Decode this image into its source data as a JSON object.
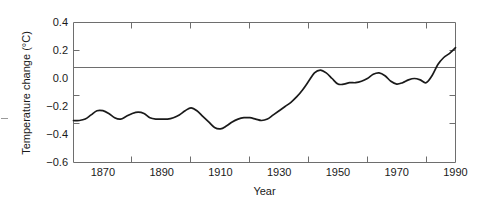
{
  "chart_data": {
    "type": "line",
    "title": "",
    "xlabel": "Year",
    "ylabel": "Temperature change (°C)",
    "xlim": [
      1860,
      1990
    ],
    "ylim": [
      -0.6,
      0.4
    ],
    "xticks": [
      1870,
      1890,
      1910,
      1930,
      1950,
      1970,
      1990
    ],
    "yticks": [
      0.4,
      0.2,
      0.0,
      -0.2,
      -0.4,
      -0.6
    ],
    "xtick_labels": [
      "1870",
      "1890",
      "1910",
      "1930",
      "1950",
      "1970",
      "1990"
    ],
    "ytick_labels": [
      "0.4",
      "0.2",
      "0.0",
      "−0.2",
      "−0.4",
      "−0.6"
    ],
    "grid": false,
    "zero_line": true,
    "legend": null,
    "line_color": "#1a1a1a",
    "axis_color": "#6e6e6e",
    "series": [
      {
        "name": "Global temperature change",
        "x": [
          1860,
          1862,
          1864,
          1866,
          1868,
          1870,
          1872,
          1874,
          1876,
          1878,
          1880,
          1882,
          1884,
          1886,
          1888,
          1890,
          1892,
          1894,
          1896,
          1898,
          1900,
          1902,
          1904,
          1906,
          1908,
          1910,
          1912,
          1914,
          1916,
          1918,
          1920,
          1922,
          1924,
          1926,
          1928,
          1930,
          1932,
          1934,
          1936,
          1938,
          1940,
          1942,
          1944,
          1946,
          1948,
          1950,
          1952,
          1954,
          1956,
          1958,
          1960,
          1962,
          1964,
          1966,
          1968,
          1970,
          1972,
          1974,
          1976,
          1978,
          1980,
          1982,
          1984,
          1986,
          1988,
          1990
        ],
        "y": [
          -0.3,
          -0.3,
          -0.29,
          -0.26,
          -0.23,
          -0.23,
          -0.25,
          -0.28,
          -0.29,
          -0.27,
          -0.25,
          -0.24,
          -0.25,
          -0.28,
          -0.29,
          -0.29,
          -0.29,
          -0.28,
          -0.26,
          -0.23,
          -0.21,
          -0.23,
          -0.27,
          -0.31,
          -0.35,
          -0.36,
          -0.34,
          -0.31,
          -0.29,
          -0.28,
          -0.28,
          -0.29,
          -0.3,
          -0.29,
          -0.26,
          -0.23,
          -0.2,
          -0.17,
          -0.13,
          -0.08,
          -0.02,
          0.04,
          0.06,
          0.04,
          0.0,
          -0.04,
          -0.04,
          -0.03,
          -0.03,
          -0.02,
          0.0,
          0.03,
          0.04,
          0.02,
          -0.02,
          -0.04,
          -0.03,
          -0.01,
          0.0,
          -0.01,
          -0.03,
          0.02,
          0.1,
          0.15,
          0.18,
          0.22
        ]
      }
    ]
  },
  "axes": {
    "y_axis_label": "Temperature change (°C)",
    "x_axis_label": "Year"
  }
}
